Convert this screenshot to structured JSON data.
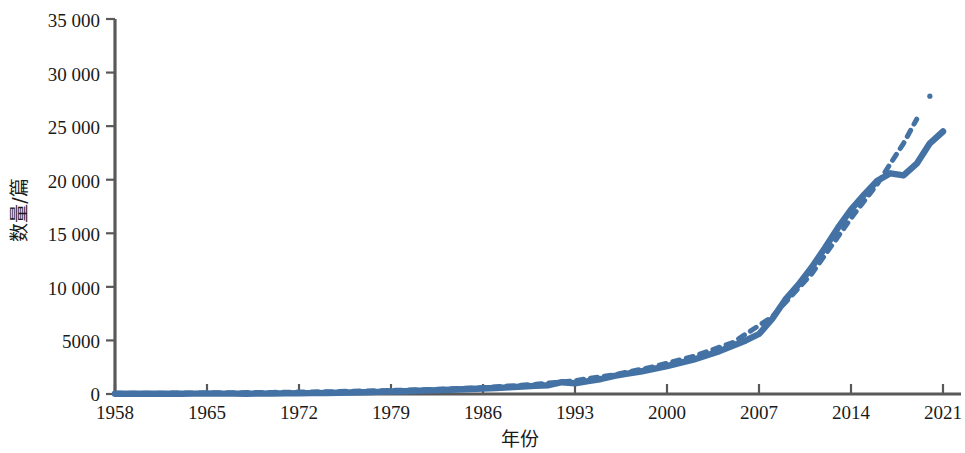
{
  "chart_data": {
    "type": "line",
    "title": "",
    "xlabel": "年份",
    "ylabel": "数量/篇",
    "xlim": [
      1958,
      2021
    ],
    "ylim": [
      0,
      35000
    ],
    "grid": false,
    "legend": "none",
    "x_ticks": [
      "1958",
      "1965",
      "1972",
      "1979",
      "1986",
      "1993",
      "2000",
      "2007",
      "2014",
      "2021"
    ],
    "x_tick_values": [
      1958,
      1965,
      1972,
      1979,
      1986,
      1993,
      2000,
      2007,
      2014,
      2021
    ],
    "y_ticks": [
      "0",
      "5000",
      "10 000",
      "15 000",
      "20 000",
      "25 000",
      "30 000",
      "35 000"
    ],
    "y_tick_values": [
      0,
      5000,
      10000,
      15000,
      20000,
      25000,
      30000,
      35000
    ],
    "colors": {
      "series_actual": "#4472A4",
      "series_trend": "#4472A4",
      "axis": "#595959",
      "text": "#1a1a1a",
      "background": "#ffffff"
    },
    "series": [
      {
        "name": "实际数量",
        "style": "solid",
        "color": "#4472A4",
        "x": [
          1958,
          1959,
          1960,
          1961,
          1962,
          1963,
          1964,
          1965,
          1966,
          1967,
          1968,
          1969,
          1970,
          1971,
          1972,
          1973,
          1974,
          1975,
          1976,
          1977,
          1978,
          1979,
          1980,
          1981,
          1982,
          1983,
          1984,
          1985,
          1986,
          1987,
          1988,
          1989,
          1990,
          1991,
          1992,
          1993,
          1994,
          1995,
          1996,
          1997,
          1998,
          1999,
          2000,
          2001,
          2002,
          2003,
          2004,
          2005,
          2006,
          2007,
          2008,
          2009,
          2010,
          2011,
          2012,
          2013,
          2014,
          2015,
          2016,
          2017,
          2018,
          2019,
          2020,
          2021
        ],
        "values": [
          20,
          25,
          30,
          28,
          26,
          30,
          35,
          40,
          38,
          35,
          30,
          32,
          40,
          55,
          70,
          85,
          100,
          120,
          140,
          170,
          200,
          230,
          260,
          300,
          340,
          380,
          420,
          470,
          520,
          560,
          620,
          700,
          760,
          820,
          1100,
          1000,
          1200,
          1400,
          1700,
          1900,
          2100,
          2350,
          2600,
          2900,
          3200,
          3600,
          4000,
          4500,
          5000,
          5600,
          7000,
          8800,
          10200,
          11800,
          13600,
          15500,
          17200,
          18600,
          19900,
          20600,
          20400,
          21500,
          23400,
          24500
        ]
      },
      {
        "name": "趋势线",
        "style": "dashed",
        "color": "#4472A4",
        "x": [
          1958,
          1962,
          1966,
          1970,
          1974,
          1978,
          1982,
          1986,
          1990,
          1993,
          1996,
          1999,
          2002,
          2005,
          2008,
          2011,
          2014,
          2016,
          2018,
          2019
        ],
        "values": [
          60,
          80,
          110,
          150,
          210,
          300,
          420,
          600,
          900,
          1250,
          1800,
          2550,
          3500,
          4800,
          7200,
          11200,
          16400,
          19600,
          23400,
          25650
        ]
      },
      {
        "name": "趋势末端点",
        "style": "point",
        "color": "#4472A4",
        "x": [
          2020
        ],
        "values": [
          27800
        ]
      }
    ]
  }
}
